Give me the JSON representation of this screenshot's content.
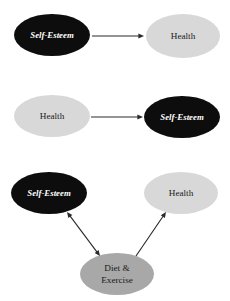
{
  "figure": {
    "background_color": "#ffffff",
    "panels": [
      {
        "id": "panel-1",
        "description": "Self-Esteem causes Health",
        "nodes": [
          {
            "id": "p1-self-esteem",
            "label": "Self-Esteem",
            "fill": "#0d0d0d",
            "text_color": "#ffffff",
            "cx": 52,
            "cy": 35,
            "rx": 38,
            "ry": 21
          },
          {
            "id": "p1-health",
            "label": "Health",
            "fill": "#d8d8d8",
            "text_color": "#1a1a1a",
            "cx": 183,
            "cy": 36,
            "rx": 37,
            "ry": 22
          }
        ],
        "edges": [
          {
            "id": "p1-edge",
            "from": "p1-self-esteem",
            "to": "p1-health",
            "direction": "single",
            "x1": 92,
            "y1": 36,
            "x2": 144,
            "y2": 36
          }
        ]
      },
      {
        "id": "panel-2",
        "description": "Health causes Self-Esteem",
        "nodes": [
          {
            "id": "p2-health",
            "label": "Health",
            "fill": "#d8d8d8",
            "text_color": "#1a1a1a",
            "cx": 52,
            "cy": 116,
            "rx": 38,
            "ry": 21
          },
          {
            "id": "p2-self-esteem",
            "label": "Self-Esteem",
            "fill": "#0d0d0d",
            "text_color": "#ffffff",
            "cx": 182,
            "cy": 117,
            "rx": 38,
            "ry": 21
          }
        ],
        "edges": [
          {
            "id": "p2-edge",
            "from": "p2-health",
            "to": "p2-self-esteem",
            "direction": "single",
            "x1": 91,
            "y1": 117,
            "x2": 143,
            "y2": 117
          }
        ]
      },
      {
        "id": "panel-3",
        "description": "Diet and Exercise relates reciprocally to Self-Esteem and causes Health",
        "nodes": [
          {
            "id": "p3-self-esteem",
            "label": "Self-Esteem",
            "fill": "#0d0d0d",
            "text_color": "#ffffff",
            "cx": 49,
            "cy": 193,
            "rx": 38,
            "ry": 21
          },
          {
            "id": "p3-health",
            "label": "Health",
            "fill": "#d8d8d8",
            "text_color": "#1a1a1a",
            "cx": 181,
            "cy": 193,
            "rx": 37,
            "ry": 21
          },
          {
            "id": "p3-diet-exercise",
            "label_line1": "Diet &",
            "label_line2": "Exercise",
            "fill": "#a8a8a8",
            "text_color": "#1a1a1a",
            "cx": 117,
            "cy": 274,
            "rx": 37,
            "ry": 21
          }
        ],
        "edges": [
          {
            "id": "p3-edge-left",
            "from": "p3-self-esteem",
            "to": "p3-diet-exercise",
            "direction": "double",
            "x1": 67,
            "y1": 212,
            "x2": 100,
            "y2": 256
          },
          {
            "id": "p3-edge-right",
            "from": "p3-diet-exercise",
            "to": "p3-health",
            "direction": "single",
            "x1": 136,
            "y1": 256,
            "x2": 166,
            "y2": 212
          }
        ]
      }
    ]
  }
}
